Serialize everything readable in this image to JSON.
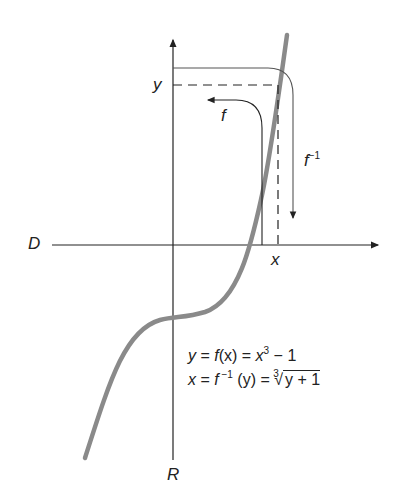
{
  "diagram": {
    "axis_labels": {
      "domain": "D",
      "range": "R",
      "x": "x",
      "y": "y"
    },
    "arrow_labels": {
      "f": "f",
      "f_inverse": "f",
      "f_inverse_sup": "−1"
    },
    "equations": {
      "line1": {
        "lhs": "y",
        "eq1": " = ",
        "f": "f",
        "arg": "(x)",
        "eq2": " = ",
        "base": "x",
        "exp": "3",
        "tail": " − 1"
      },
      "line2": {
        "lhs": "x",
        "eq1": " = ",
        "f": "f",
        "exp": " −1",
        "arg": " (y)",
        "eq2": " = ",
        "index": "3",
        "radicand": "y + 1"
      }
    },
    "colors": {
      "axes": "#222222",
      "curve": "#8a8a8a"
    }
  }
}
